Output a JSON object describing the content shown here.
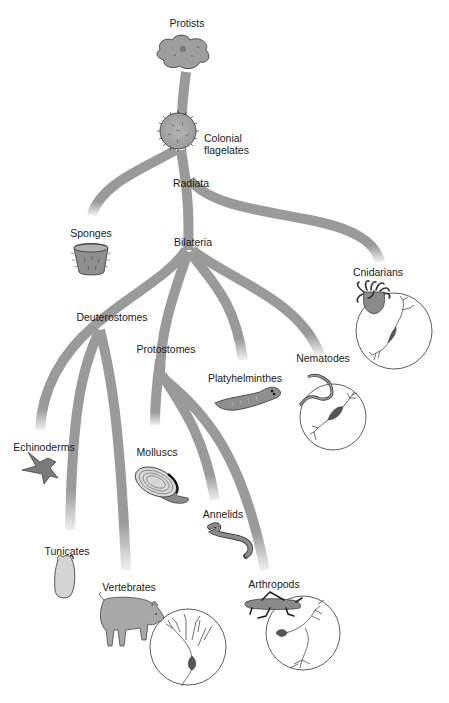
{
  "diagram": {
    "type": "phylogenetic-tree",
    "title": "",
    "branch_color": "#9a9a9a",
    "organism_fill": "#8c8c8c",
    "line_color": "#2a2a2a",
    "nodes": {
      "root": {
        "label": "Protists"
      },
      "colonial": {
        "label_line1": "Colonial",
        "label_line2": "flagelates"
      },
      "radiata": {
        "label": "Radiata"
      },
      "bilateria": {
        "label": "Bilateria"
      },
      "deuterostomes": {
        "label": "Deuterostomes"
      },
      "protostomes": {
        "label": "Protostomes"
      }
    },
    "leaves": [
      {
        "id": "sponges",
        "label": "Sponges"
      },
      {
        "id": "cnidarians",
        "label": "Cnidarians",
        "neuron_inset": true
      },
      {
        "id": "nematodes",
        "label": "Nematodes",
        "neuron_inset": true
      },
      {
        "id": "platyhelminthes",
        "label": "Platyhelminthes"
      },
      {
        "id": "echinoderms",
        "label": "Echinoderms"
      },
      {
        "id": "molluscs",
        "label": "Molluscs"
      },
      {
        "id": "annelids",
        "label": "Annelids"
      },
      {
        "id": "tunicates",
        "label": "Tunicates"
      },
      {
        "id": "vertebrates",
        "label": "Vertebrates",
        "neuron_inset": true
      },
      {
        "id": "arthropods",
        "label": "Arthropods",
        "neuron_inset": true
      }
    ],
    "edges": [
      [
        "Protists",
        "Colonial flagelates"
      ],
      [
        "Colonial flagelates",
        "Sponges"
      ],
      [
        "Colonial flagelates",
        "Radiata"
      ],
      [
        "Radiata",
        "Cnidarians"
      ],
      [
        "Radiata",
        "Bilateria"
      ],
      [
        "Bilateria",
        "Deuterostomes"
      ],
      [
        "Bilateria",
        "Protostomes"
      ],
      [
        "Bilateria",
        "Platyhelminthes"
      ],
      [
        "Bilateria",
        "Nematodes"
      ],
      [
        "Deuterostomes",
        "Echinoderms"
      ],
      [
        "Deuterostomes",
        "Tunicates"
      ],
      [
        "Deuterostomes",
        "Vertebrates"
      ],
      [
        "Protostomes",
        "Molluscs"
      ],
      [
        "Protostomes",
        "Annelids"
      ],
      [
        "Protostomes",
        "Arthropods"
      ]
    ]
  }
}
